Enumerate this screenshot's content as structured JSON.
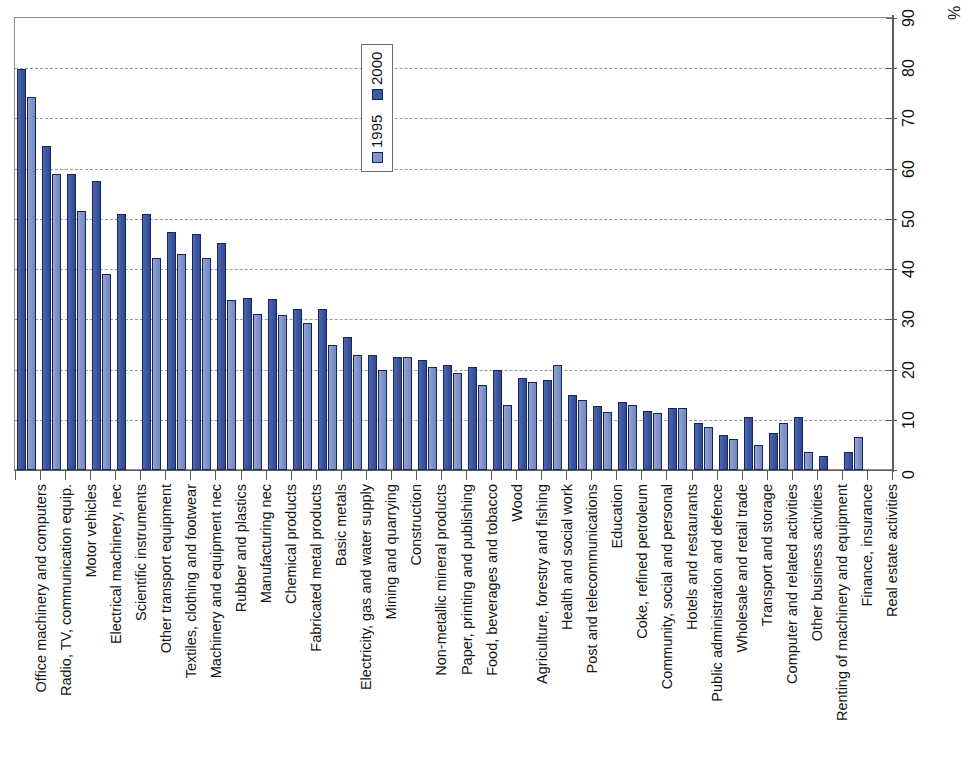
{
  "chart_data": {
    "type": "bar",
    "title": "",
    "subtitle": "",
    "xlabel": "",
    "ylabel": "%",
    "ylim": [
      0,
      90
    ],
    "yticks": [
      0,
      10,
      20,
      30,
      40,
      50,
      60,
      70,
      80,
      90
    ],
    "grid": "horizontal dashed",
    "axis_position": "right",
    "legend_position": "top-center-inside",
    "orientation": "vertical",
    "categories": [
      "Office machinery and computers",
      "Radio, TV, communication equip.",
      "Motor vehicles",
      "Electrical machinery, nec",
      "Scientific instruments",
      "Other transport equipment",
      "Textiles, clothing and footwear",
      "Machinery and equipment nec",
      "Rubber and plastics",
      "Manufacturing nec",
      "Chemical products",
      "Fabricated metal products",
      "Basic metals",
      "Electricity, gas and water supply",
      "Mining and quarrying",
      "Construction",
      "Non-metallic mineral products",
      "Paper, printing and publishing",
      "Food, beverages and tobacco",
      "Wood",
      "Agriculture, forestry and fishing",
      "Health and social work",
      "Post and telecommunications",
      "Education",
      "Coke, refined petroleum",
      "Community, social and personal",
      "Hotels and restaurants",
      "Public administration and defence",
      "Wholesale and retail trade",
      "Transport and storage",
      "Computer and related activities",
      "Other business activities",
      "Renting of machinery and equipment",
      "Finance, insurance",
      "Real estate activities"
    ],
    "series": [
      {
        "name": "2000",
        "color": "#3f5aa4",
        "values": [
          79.8,
          64.5,
          59.0,
          57.5,
          51.0,
          51.0,
          47.3,
          47.0,
          45.3,
          34.2,
          34.0,
          32.0,
          32.0,
          26.5,
          23.0,
          22.5,
          22.0,
          21.0,
          20.5,
          20.0,
          18.3,
          18.0,
          15.0,
          12.8,
          13.5,
          11.8,
          12.3,
          9.3,
          7.0,
          10.5,
          7.3,
          10.5,
          2.8,
          3.5,
          0.0
        ]
      },
      {
        "name": "1995",
        "color": "#8496c9",
        "values": [
          74.3,
          59.0,
          51.5,
          39.0,
          0.0,
          42.3,
          43.0,
          42.3,
          33.8,
          31.0,
          30.8,
          29.3,
          24.8,
          23.0,
          20.0,
          22.5,
          20.5,
          19.3,
          17.0,
          13.0,
          17.5,
          21.0,
          14.0,
          11.5,
          13.0,
          11.3,
          12.3,
          8.5,
          6.2,
          5.0,
          9.3,
          3.5,
          0.0,
          6.5,
          0.0
        ]
      }
    ],
    "legend": [
      "2000",
      "1995"
    ]
  },
  "axis": {
    "unit_label": "%",
    "tick_labels": [
      "0",
      "10",
      "20",
      "30",
      "40",
      "50",
      "60",
      "70",
      "80",
      "90"
    ]
  }
}
